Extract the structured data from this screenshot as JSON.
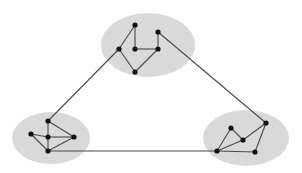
{
  "diagram": {
    "type": "clustered-graph",
    "width": 302,
    "height": 173,
    "colors": {
      "background": "#ffffff",
      "cluster_fill": "#d9d9d9",
      "edge": "#4a4a4a",
      "node": "#111111"
    },
    "clusters": [
      {
        "id": "top",
        "cx": 148,
        "cy": 45,
        "rx": 47,
        "ry": 32
      },
      {
        "id": "left",
        "cx": 51,
        "cy": 138,
        "rx": 39,
        "ry": 26
      },
      {
        "id": "right",
        "cx": 246,
        "cy": 138,
        "rx": 43,
        "ry": 28
      }
    ],
    "nodes": [
      {
        "id": "A",
        "cluster": "top",
        "x": 135,
        "y": 25
      },
      {
        "id": "B",
        "cluster": "top",
        "x": 119,
        "y": 49
      },
      {
        "id": "C",
        "cluster": "top",
        "x": 135,
        "y": 49
      },
      {
        "id": "D",
        "cluster": "top",
        "x": 158,
        "y": 32
      },
      {
        "id": "E",
        "cluster": "top",
        "x": 158,
        "y": 49
      },
      {
        "id": "F",
        "cluster": "top",
        "x": 135,
        "y": 72
      },
      {
        "id": "G",
        "cluster": "left",
        "x": 48,
        "y": 121
      },
      {
        "id": "H",
        "cluster": "left",
        "x": 31,
        "y": 134
      },
      {
        "id": "I",
        "cluster": "left",
        "x": 48,
        "y": 137
      },
      {
        "id": "J",
        "cluster": "left",
        "x": 74,
        "y": 137
      },
      {
        "id": "K",
        "cluster": "left",
        "x": 48,
        "y": 151
      },
      {
        "id": "L",
        "cluster": "right",
        "x": 266,
        "y": 123
      },
      {
        "id": "M",
        "cluster": "right",
        "x": 231,
        "y": 128
      },
      {
        "id": "N",
        "cluster": "right",
        "x": 243,
        "y": 140
      },
      {
        "id": "O",
        "cluster": "right",
        "x": 217,
        "y": 151
      },
      {
        "id": "P",
        "cluster": "right",
        "x": 255,
        "y": 152
      }
    ],
    "edges": [
      [
        "A",
        "B"
      ],
      [
        "A",
        "C"
      ],
      [
        "C",
        "E"
      ],
      [
        "D",
        "E"
      ],
      [
        "B",
        "F"
      ],
      [
        "E",
        "F"
      ],
      [
        "G",
        "I"
      ],
      [
        "I",
        "K"
      ],
      [
        "G",
        "J"
      ],
      [
        "H",
        "I"
      ],
      [
        "I",
        "J"
      ],
      [
        "H",
        "K"
      ],
      [
        "J",
        "K"
      ],
      [
        "O",
        "M"
      ],
      [
        "M",
        "N"
      ],
      [
        "O",
        "N"
      ],
      [
        "N",
        "L"
      ],
      [
        "L",
        "P"
      ],
      [
        "O",
        "P"
      ],
      [
        "B",
        "G"
      ],
      [
        "D",
        "L"
      ],
      [
        "K",
        "O"
      ]
    ]
  }
}
